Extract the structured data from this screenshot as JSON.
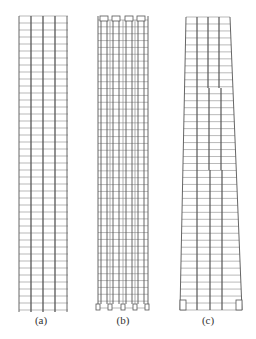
{
  "figure": {
    "panels": [
      {
        "id": "a",
        "label": "(a)",
        "description": "Uniform frame with 4 bays, continuous columns, many floors",
        "left": 19,
        "right": 68,
        "top": 16,
        "bottom": 310,
        "columns": [
          19,
          31,
          43,
          55,
          67
        ],
        "floors": 42,
        "label_x": 41
      },
      {
        "id": "b",
        "label": "(b)",
        "description": "Frame with 4 bays, each bay containing a cantilevered box-column; boxes at top and bottom",
        "left": 98,
        "right": 148,
        "top": 16,
        "bottom": 310,
        "columns": [
          98,
          110,
          123,
          135,
          147
        ],
        "floors": 42,
        "label_x": 123
      },
      {
        "id": "c",
        "label": "(c)",
        "description": "Tapered frame, wider at base, with stepped column offsets",
        "top_left": 186,
        "top_right": 230,
        "bottom_left": 180,
        "bottom_right": 242,
        "top": 17,
        "bottom": 310,
        "floors": 42,
        "label_x": 208
      }
    ],
    "line_color": "#555555",
    "grid_color": "#8a8a8a"
  }
}
